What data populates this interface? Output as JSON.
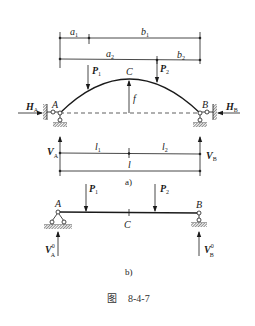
{
  "figure": {
    "caption_prefix": "图",
    "caption_number": "8-4-7",
    "panel_a_label": "a)",
    "panel_b_label": "b)"
  },
  "panel_a": {
    "dimensions_top": {
      "a1": {
        "main": "a",
        "sub": "1"
      },
      "b1": {
        "main": "b",
        "sub": "1"
      },
      "a2": {
        "main": "a",
        "sub": "2"
      },
      "b2": {
        "main": "b",
        "sub": "2"
      }
    },
    "loads": {
      "P1": {
        "main": "P",
        "sub": "1"
      },
      "P2": {
        "main": "P",
        "sub": "2"
      }
    },
    "crown_label": "C",
    "rise_label": "f",
    "support_A_label": "A",
    "support_B_label": "B",
    "reactions": {
      "HA": {
        "main": "H",
        "sub": "A"
      },
      "HB": {
        "main": "H",
        "sub": "B"
      },
      "VA": {
        "main": "V",
        "sub": "A"
      },
      "VB": {
        "main": "V",
        "sub": "B"
      }
    },
    "dimensions_bottom": {
      "l1": {
        "main": "l",
        "sub": "1"
      },
      "l2": {
        "main": "l",
        "sub": "2"
      },
      "l": "l"
    }
  },
  "panel_b": {
    "loads": {
      "P1": {
        "main": "P",
        "sub": "1"
      },
      "P2": {
        "main": "P",
        "sub": "2"
      }
    },
    "midpoint_label": "C",
    "support_A_label": "A",
    "support_B_label": "B",
    "reactions": {
      "VA0": {
        "main": "V",
        "sup": "0",
        "sub": "A"
      },
      "VB0": {
        "main": "V",
        "sup": "0",
        "sub": "B"
      }
    }
  },
  "colors": {
    "line": "#1a1a1a",
    "background": "#ffffff"
  }
}
